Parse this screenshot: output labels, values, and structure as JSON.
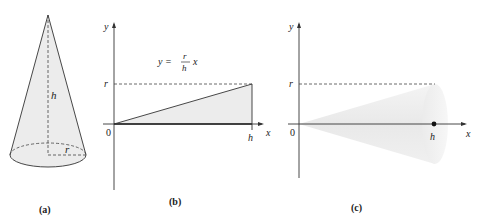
{
  "panels": {
    "a": {
      "caption": "(a)",
      "height_label": "h",
      "radius_label": "r"
    },
    "b": {
      "caption": "(b)",
      "y_axis_label": "y",
      "x_axis_label": "x",
      "origin_label": "0",
      "r_tick_label": "r",
      "h_tick_label": "h",
      "equation": {
        "lhs": "y =",
        "numerator": "r",
        "denominator": "h",
        "var": "x"
      }
    },
    "c": {
      "caption": "(c)",
      "y_axis_label": "y",
      "x_axis_label": "x",
      "origin_label": "0",
      "r_tick_label": "r",
      "h_tick_label": "h"
    }
  },
  "colors": {
    "fill": "#ececec",
    "stroke": "#333333",
    "dash": "#444444"
  }
}
